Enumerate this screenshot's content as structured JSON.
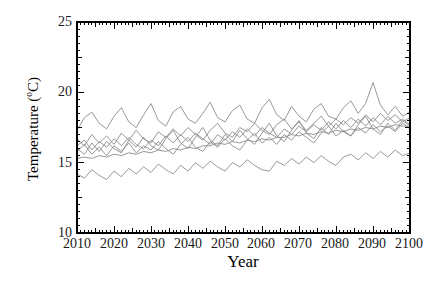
{
  "page": {
    "background": "#ffffff"
  },
  "chart_data": {
    "type": "line",
    "title": "",
    "xlabel": "Year",
    "ylabel": "Temperature (°C)",
    "ylabel_parts": {
      "pre": "Temperature (",
      "sup": "o",
      "post": "C)"
    },
    "xlim": [
      2010,
      2100
    ],
    "ylim": [
      10,
      25
    ],
    "x_ticks": [
      2010,
      2020,
      2030,
      2040,
      2050,
      2060,
      2070,
      2080,
      2090,
      2100
    ],
    "y_ticks": [
      25,
      20,
      15,
      10
    ],
    "x_step_minor": 1,
    "x_step_medium": 5,
    "x_step_major": 10,
    "y_step_minor": 0.5,
    "y_step_medium": 2.5,
    "y_step_major": 5,
    "grid": false,
    "legend": false,
    "axis_color": "#000000",
    "line_color": "#8c8c8c",
    "x": [
      2010,
      2012,
      2014,
      2016,
      2018,
      2020,
      2022,
      2024,
      2026,
      2028,
      2030,
      2032,
      2034,
      2036,
      2038,
      2040,
      2042,
      2044,
      2046,
      2048,
      2050,
      2052,
      2054,
      2056,
      2058,
      2060,
      2062,
      2064,
      2066,
      2068,
      2070,
      2072,
      2074,
      2076,
      2078,
      2080,
      2082,
      2084,
      2086,
      2088,
      2090,
      2092,
      2094,
      2096,
      2098,
      2100
    ],
    "series": [
      {
        "name": "line-1",
        "values": [
          17.3,
          18.2,
          18.6,
          17.8,
          17.4,
          18.3,
          18.9,
          17.9,
          17.5,
          18.4,
          19.2,
          18.0,
          17.6,
          18.6,
          19.0,
          18.1,
          17.8,
          18.5,
          19.3,
          18.2,
          17.9,
          18.7,
          19.1,
          18.1,
          17.8,
          18.9,
          19.5,
          18.4,
          18.0,
          19.0,
          18.3,
          17.9,
          18.8,
          19.2,
          18.3,
          18.1,
          18.9,
          19.4,
          18.5,
          19.2,
          20.7,
          19.1,
          18.4,
          19.0,
          18.3,
          18.6
        ]
      },
      {
        "name": "line-2",
        "values": [
          16.7,
          16.2,
          17.0,
          16.4,
          16.9,
          16.3,
          17.1,
          16.6,
          17.3,
          16.7,
          16.4,
          17.2,
          16.8,
          17.4,
          16.9,
          17.5,
          17.0,
          16.6,
          17.3,
          17.8,
          17.1,
          16.8,
          17.5,
          17.2,
          17.8,
          17.3,
          17.0,
          17.7,
          18.1,
          17.4,
          17.9,
          17.3,
          17.8,
          18.3,
          17.6,
          18.1,
          17.7,
          18.2,
          17.8,
          18.4,
          17.9,
          18.5,
          18.0,
          18.4,
          17.9,
          18.2
        ]
      },
      {
        "name": "line-3",
        "values": [
          16.2,
          16.6,
          15.9,
          16.5,
          16.1,
          16.7,
          16.2,
          16.8,
          16.3,
          16.0,
          16.6,
          16.2,
          16.9,
          16.4,
          17.0,
          16.5,
          17.1,
          16.7,
          16.3,
          17.0,
          16.6,
          17.2,
          16.8,
          17.4,
          16.9,
          17.5,
          17.1,
          16.8,
          17.4,
          17.0,
          17.6,
          17.2,
          17.7,
          17.3,
          17.9,
          17.4,
          18.0,
          17.5,
          18.1,
          17.6,
          18.2,
          17.7,
          18.3,
          17.8,
          18.1,
          17.7
        ]
      },
      {
        "name": "line-4",
        "values": [
          16.0,
          15.6,
          16.4,
          15.8,
          16.5,
          16.0,
          15.7,
          16.6,
          16.1,
          16.8,
          16.2,
          15.9,
          16.7,
          17.3,
          16.4,
          16.0,
          16.8,
          17.5,
          16.6,
          16.2,
          17.0,
          16.5,
          17.3,
          16.7,
          16.3,
          17.1,
          17.8,
          16.9,
          16.5,
          17.3,
          18.0,
          17.1,
          16.7,
          17.5,
          17.0,
          17.8,
          17.2,
          16.9,
          17.7,
          18.3,
          17.4,
          17.0,
          17.8,
          17.3,
          18.0,
          17.6
        ]
      },
      {
        "name": "line-5",
        "values": [
          15.8,
          16.3,
          15.6,
          16.1,
          15.5,
          16.2,
          15.8,
          16.4,
          15.7,
          16.2,
          15.9,
          16.5,
          16.0,
          15.6,
          16.3,
          16.8,
          16.1,
          15.8,
          16.5,
          16.1,
          16.7,
          16.2,
          15.9,
          16.6,
          17.1,
          16.4,
          16.8,
          16.3,
          17.0,
          16.6,
          17.2,
          16.8,
          16.4,
          17.1,
          17.6,
          16.9,
          17.3,
          16.9,
          17.5,
          17.1,
          17.7,
          17.2,
          17.6,
          17.2,
          17.8,
          17.4
        ]
      },
      {
        "name": "line-6",
        "values": [
          15.3,
          15.4,
          15.3,
          15.5,
          15.4,
          15.6,
          15.5,
          15.7,
          15.6,
          15.8,
          15.7,
          15.9,
          15.8,
          16.0,
          15.9,
          16.1,
          16.0,
          16.2,
          16.2,
          16.4,
          16.3,
          16.5,
          16.4,
          16.6,
          16.5,
          16.7,
          16.6,
          16.8,
          16.8,
          17.0,
          16.9,
          17.1,
          17.0,
          17.2,
          17.1,
          17.3,
          17.2,
          17.4,
          17.3,
          17.5,
          17.4,
          17.6,
          17.5,
          17.7,
          17.6,
          17.6
        ]
      },
      {
        "name": "line-7",
        "values": [
          14.2,
          13.9,
          14.5,
          14.1,
          13.8,
          14.4,
          14.0,
          14.6,
          14.2,
          14.7,
          14.3,
          14.9,
          14.5,
          14.2,
          14.8,
          14.4,
          15.0,
          14.6,
          15.1,
          14.7,
          14.4,
          15.0,
          14.7,
          15.2,
          14.8,
          14.5,
          14.4,
          15.1,
          14.8,
          15.3,
          14.9,
          15.4,
          15.0,
          15.5,
          15.1,
          14.8,
          15.4,
          15.6,
          15.2,
          15.7,
          15.3,
          15.8,
          15.4,
          15.9,
          15.5,
          15.7
        ]
      }
    ]
  }
}
